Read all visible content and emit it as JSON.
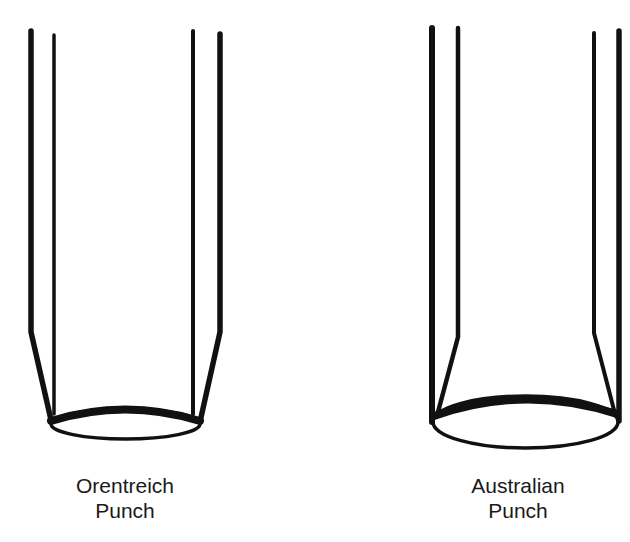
{
  "figure": {
    "background": "#ffffff",
    "stroke_color": "#111111",
    "punches": [
      {
        "id": "orentreich",
        "label_line1": "Orentreich",
        "label_line2": "Punch",
        "description": "Outer walls taper inward near the base to meet the cutting edge; inner walls straight"
      },
      {
        "id": "australian",
        "label_line1": "Australian",
        "label_line2": "Punch",
        "description": "Outer walls straight down to the cutting edge; inner walls flare outward near the base"
      }
    ]
  }
}
